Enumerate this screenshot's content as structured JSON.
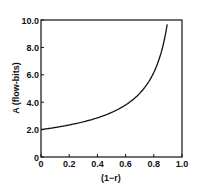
{
  "chart_data": {
    "type": "line",
    "title": "",
    "xlabel": "(1−r)",
    "ylabel": "A (flow-bits)",
    "xlim": [
      0,
      1.0
    ],
    "ylim": [
      0,
      10.0
    ],
    "x_ticks": [
      "0",
      "0.2",
      "0.4",
      "0.6",
      "0.8",
      "1.0"
    ],
    "y_ticks": [
      "0",
      "2.0",
      "4.0",
      "6.0",
      "8.0",
      "10.0"
    ],
    "grid": false,
    "series": [
      {
        "name": "A",
        "x": [
          0,
          0.1,
          0.2,
          0.3,
          0.4,
          0.5,
          0.6,
          0.7,
          0.8,
          0.85,
          0.9
        ],
        "values": [
          2.0,
          2.1,
          2.2,
          2.35,
          2.6,
          2.9,
          3.4,
          4.2,
          5.8,
          7.3,
          10.0
        ]
      }
    ]
  }
}
